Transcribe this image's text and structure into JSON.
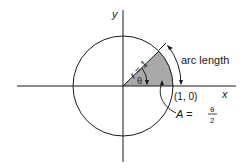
{
  "diagram": {
    "axes": {
      "x_label": "x",
      "y_label": "y"
    },
    "radius_label": "r = 1",
    "angle_label": "θ",
    "arc_label": "arc length",
    "point_label": "(1, 0)",
    "area_label_prefix": "A =",
    "area_numerator": "θ",
    "area_denominator": "2",
    "colors": {
      "line": "#1a1a1a",
      "sector_fill": "#a9a9a9",
      "background": "#ffffff"
    }
  }
}
